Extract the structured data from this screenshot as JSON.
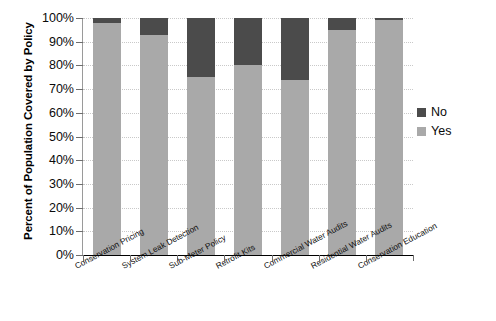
{
  "chart_data": {
    "type": "bar",
    "subtype": "stacked-100-percent",
    "title": "",
    "xlabel": "",
    "ylabel": "Percent of Population Covered by Policy",
    "ylim": [
      0,
      100
    ],
    "ytick_labels": [
      "100%",
      "90%",
      "80%",
      "70%",
      "60%",
      "50%",
      "40%",
      "30%",
      "20%",
      "10%",
      "0%"
    ],
    "ytick_values": [
      100,
      90,
      80,
      70,
      60,
      50,
      40,
      30,
      20,
      10,
      0
    ],
    "grid": true,
    "grid_axis": "y",
    "legend_position": "right",
    "categories": [
      "Conservation Pricing",
      "System Leak Detection",
      "Sub-Meter Policy",
      "Retrofit Kits",
      "Commercial Water Audits",
      "Residential Water Audits",
      "Conservation Education"
    ],
    "series": [
      {
        "name": "Yes",
        "color": "#a9a9a9",
        "values": [
          98,
          93,
          75,
          80,
          74,
          95,
          99
        ]
      },
      {
        "name": "No",
        "color": "#4b4b4b",
        "values": [
          2,
          7,
          25,
          20,
          26,
          5,
          1
        ]
      }
    ]
  },
  "legend": {
    "items": [
      {
        "label": "No",
        "color": "#4b4b4b"
      },
      {
        "label": "Yes",
        "color": "#a9a9a9"
      }
    ]
  },
  "colors": {
    "yes": "#a9a9a9",
    "no": "#4b4b4b",
    "axis": "#9a9a9a",
    "grid": "#c9c9c9",
    "text": "#0a0a0a",
    "background": "#ffffff"
  }
}
